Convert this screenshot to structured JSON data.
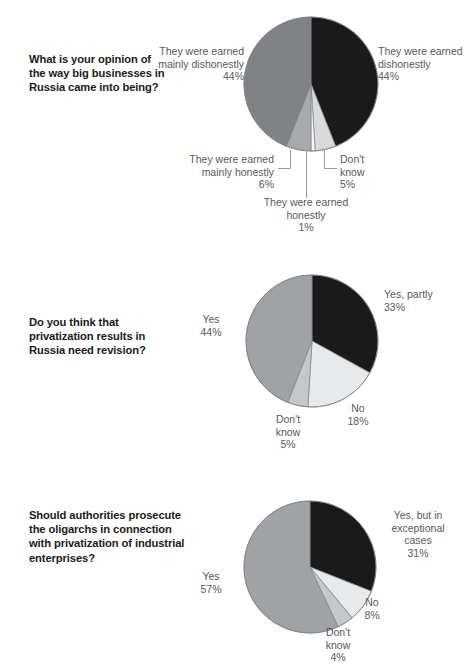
{
  "page": {
    "background": "#ffffff",
    "text_color": "#1a1a1a",
    "label_color": "#58595b"
  },
  "palette": {
    "black": "#1a1a1a",
    "dark_gray": "#808285",
    "mid_gray": "#a7a9ac",
    "light_gray": "#d9dadb",
    "near_white": "#f1f2f2",
    "outline": "#808285",
    "leader_line": "#9a9a9a"
  },
  "chart_data": [
    {
      "type": "pie",
      "id": "chart-1",
      "title": "What is your opinion of the way big businesses in Russia came into being?",
      "question": "What is your opinion of the way big businesses in Russia came into being?",
      "start_angle_deg": 0,
      "direction": "clockwise",
      "labels": [
        "They were earned dishonestly",
        "Don't know",
        "They were earned honestly",
        "They were earned mainly honestly",
        "They were earned mainly dishonestly"
      ],
      "values": [
        44,
        5,
        1,
        6,
        44
      ],
      "value_suffix": "%",
      "colors": [
        "#1a1a1a",
        "#d9dadb",
        "#f7f7f7",
        "#a7a9ac",
        "#808285"
      ],
      "slices": [
        {
          "label": "They were earned dishonestly",
          "value": 44,
          "value_text": "44%",
          "color": "#1a1a1a"
        },
        {
          "label": "Don't know",
          "value": 5,
          "value_text": "5%",
          "color": "#d9dadb"
        },
        {
          "label": "They were earned honestly",
          "value": 1,
          "value_text": "1%",
          "color": "#f7f7f7"
        },
        {
          "label": "They were earned mainly honestly",
          "value": 6,
          "value_text": "6%",
          "color": "#a7a9ac"
        },
        {
          "label": "They were earned mainly dishonestly",
          "value": 44,
          "value_text": "44%",
          "color": "#808285"
        }
      ]
    },
    {
      "type": "pie",
      "id": "chart-2",
      "title": "Do you think that privatization results in Russia need revision?",
      "question": "Do you think that privatization results in Russia need revision?",
      "start_angle_deg": 0,
      "direction": "clockwise",
      "labels": [
        "Yes, partly",
        "No",
        "Don't know",
        "Yes"
      ],
      "values": [
        33,
        18,
        5,
        44
      ],
      "value_suffix": "%",
      "colors": [
        "#1a1a1a",
        "#e8e9ea",
        "#c6c7c9",
        "#a0a2a5"
      ],
      "slices": [
        {
          "label": "Yes, partly",
          "value": 33,
          "value_text": "33%",
          "color": "#1a1a1a"
        },
        {
          "label": "No",
          "value": 18,
          "value_text": "18%",
          "color": "#e8e9ea"
        },
        {
          "label": "Don't know",
          "value": 5,
          "value_text": "5%",
          "color": "#c6c7c9"
        },
        {
          "label": "Yes",
          "value": 44,
          "value_text": "44%",
          "color": "#a0a2a5"
        }
      ]
    },
    {
      "type": "pie",
      "id": "chart-3",
      "title": "Should authorities prosecute the oligarchs in connection with privatization of industrial enterprises?",
      "question": "Should authorities prosecute the oligarchs in connection with privatization of industrial enterprises?",
      "start_angle_deg": 0,
      "direction": "clockwise",
      "labels": [
        "Yes, but in exceptional cases",
        "No",
        "Don't know",
        "Yes"
      ],
      "values": [
        31,
        8,
        4,
        57
      ],
      "value_suffix": "%",
      "colors": [
        "#1a1a1a",
        "#e8e9ea",
        "#c6c7c9",
        "#a0a2a5"
      ],
      "slices": [
        {
          "label": "Yes, but in exceptional cases",
          "value": 31,
          "value_text": "31%",
          "color": "#1a1a1a"
        },
        {
          "label": "No",
          "value": 8,
          "value_text": "8%",
          "color": "#e8e9ea"
        },
        {
          "label": "Don't know",
          "value": 4,
          "value_text": "4%",
          "color": "#c6c7c9"
        },
        {
          "label": "Yes",
          "value": 57,
          "value_text": "57%",
          "color": "#a0a2a5"
        }
      ]
    }
  ],
  "charts": [
    {
      "question": "What is your opinion of the way big businesses in Russia came into being?",
      "callouts": [
        {
          "name": "earned-dishonestly",
          "text": "They were earned\ndishonestly\n44%"
        },
        {
          "name": "earned-mainly-dishonestly",
          "text": "They were earned\nmainly dishonestly\n44%"
        },
        {
          "name": "earned-mainly-honestly",
          "text": "They were earned\nmainly honestly\n6%"
        },
        {
          "name": "earned-honestly",
          "text": "They were earned\nhonestly\n1%"
        },
        {
          "name": "dont-know",
          "text": "Don't\nknow\n5%"
        }
      ]
    },
    {
      "question": "Do you think that privatization results in Russia need revision?",
      "callouts": [
        {
          "name": "yes-partly",
          "text": "Yes, partly\n33%"
        },
        {
          "name": "no",
          "text": "No\n18%"
        },
        {
          "name": "dont-know",
          "text": "Don't\nknow\n5%"
        },
        {
          "name": "yes",
          "text": "Yes\n44%"
        }
      ]
    },
    {
      "question": "Should authorities prosecute the oligarchs in connection with privatization of industrial enterprises?",
      "callouts": [
        {
          "name": "yes-but-exceptional",
          "text": "Yes, but in\nexceptional\ncases\n31%"
        },
        {
          "name": "no",
          "text": "No\n8%"
        },
        {
          "name": "dont-know",
          "text": "Don't\nknow\n4%"
        },
        {
          "name": "yes",
          "text": "Yes\n57%"
        }
      ]
    }
  ]
}
